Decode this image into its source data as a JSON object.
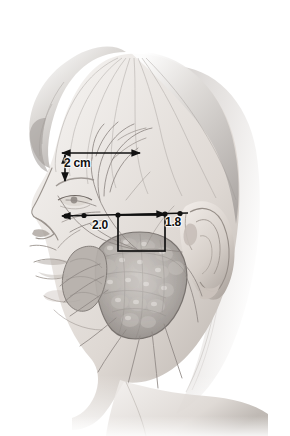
{
  "figure": {
    "width": 290,
    "height": 436,
    "background_color": "#ffffff",
    "ink_color": "#111111",
    "skin_light": "#f2efec",
    "skin_mid": "#d8d2cd",
    "skin_shadow": "#a9a29c",
    "hair_color": "#b9b4b0",
    "gland_color": "#9e9894"
  },
  "annotations": {
    "top_measure": {
      "label": "2 cm",
      "kind": "horizontal-arrow-with-vertical-depth-arrow"
    },
    "anterior_measure": {
      "label": "2.0",
      "kind": "distance-along-tragal-line"
    },
    "posterior_measure": {
      "label": "1.8",
      "kind": "distance-along-tragal-line"
    },
    "box": {
      "label": "",
      "kind": "region-of-interest-rectangle"
    }
  },
  "anatomy": {
    "parts": [
      {
        "name": "hair",
        "label": "Hair"
      },
      {
        "name": "forehead",
        "label": "Forehead"
      },
      {
        "name": "eyebrow",
        "label": "Eyebrow"
      },
      {
        "name": "eye",
        "label": "Eye"
      },
      {
        "name": "nose",
        "label": "Nose"
      },
      {
        "name": "lips",
        "label": "Lips"
      },
      {
        "name": "chin",
        "label": "Chin"
      },
      {
        "name": "ear",
        "label": "Auricle"
      },
      {
        "name": "tragus",
        "label": "Tragus"
      },
      {
        "name": "parotid-gland",
        "label": "Parotid gland"
      },
      {
        "name": "facial-nerve",
        "label": "Facial nerve branches"
      },
      {
        "name": "neck",
        "label": "Neck"
      }
    ]
  }
}
